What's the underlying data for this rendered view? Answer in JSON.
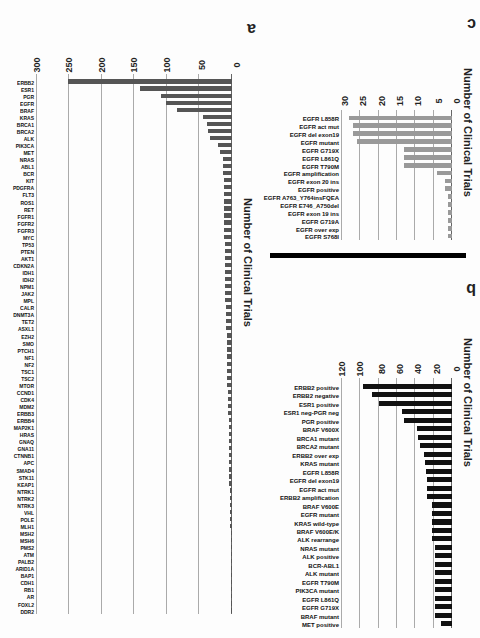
{
  "figure": {
    "panel_a": {
      "letter": "a",
      "ylabel": "Number of Clinical Trials"
    },
    "panel_b": {
      "letter": "b",
      "ylabel": "Number of Clinical Trials"
    },
    "panel_c": {
      "letter": "c",
      "ylabel": "Number of Clinical Trials"
    },
    "orientation": "rotated 180 degrees"
  },
  "chart_data": [
    {
      "panel": "a",
      "type": "bar",
      "title": "",
      "xlabel": "",
      "ylabel": "Number of Clinical Trials",
      "ylim": [
        0,
        300
      ],
      "yticks": [
        0,
        50,
        100,
        150,
        200,
        250,
        300
      ],
      "grid": true,
      "bar_color": "#555555",
      "categories": [
        "ERBB2",
        "ESR1",
        "PGR",
        "EGFR",
        "BRAF",
        "KRAS",
        "BRCA1",
        "BRCA2",
        "ALK",
        "PIK3CA",
        "MET",
        "NRAS",
        "ABL1",
        "BCR",
        "KIT",
        "PDGFRA",
        "FLT3",
        "ROS1",
        "RET",
        "FGFR1",
        "FGFR2",
        "FGFR3",
        "MYC",
        "TP53",
        "PTEN",
        "AKT1",
        "CDKN2A",
        "IDH1",
        "IDH2",
        "NPM1",
        "JAK2",
        "MPL",
        "CALR",
        "DNMT3A",
        "TET2",
        "ASXL1",
        "EZH2",
        "SMO",
        "PTCH1",
        "NF1",
        "NF2",
        "TSC1",
        "TSC2",
        "MTOR",
        "CCND1",
        "CDK4",
        "MDM2",
        "ERBB3",
        "ERBB4",
        "MAP2K1",
        "HRAS",
        "GNAQ",
        "GNA11",
        "CTNNB1",
        "APC",
        "SMAD4",
        "STK11",
        "KEAP1",
        "NTRK1",
        "NTRK2",
        "NTRK3",
        "VHL",
        "POLE",
        "MLH1",
        "MSH2",
        "MSH6",
        "PMS2",
        "ATM",
        "PALB2",
        "ARID1A",
        "BAP1",
        "CDH1",
        "RB1",
        "AR",
        "FOXL2",
        "DDR2"
      ],
      "values": [
        253,
        142,
        109,
        102,
        85,
        44,
        38,
        37,
        34,
        22,
        18,
        14,
        14,
        14,
        13,
        13,
        13,
        13,
        12,
        12,
        12,
        12,
        12,
        11,
        11,
        11,
        11,
        11,
        10,
        10,
        10,
        10,
        9,
        9,
        9,
        9,
        8,
        8,
        8,
        8,
        7,
        7,
        7,
        7,
        6,
        6,
        6,
        6,
        5,
        5,
        5,
        5,
        5,
        4,
        4,
        4,
        4,
        4,
        3,
        3,
        3,
        3,
        3,
        3,
        2,
        2,
        2,
        2,
        2,
        2,
        2,
        1,
        1,
        1,
        1,
        1
      ]
    },
    {
      "panel": "b",
      "type": "bar",
      "title": "",
      "xlabel": "",
      "ylabel": "Number of Clinical Trials",
      "ylim": [
        0,
        120
      ],
      "yticks": [
        0,
        20,
        40,
        60,
        80,
        100,
        120
      ],
      "grid": true,
      "bar_color": "#111111",
      "categories": [
        "ERBB2 positive",
        "ERBB2 negative",
        "ESR1 positive",
        "ESR1 neg-PGR neg",
        "PGR positive",
        "BRAF V600X",
        "BRCA1 mutant",
        "BRCA2 mutant",
        "ERBB2 over exp",
        "KRAS mutant",
        "EGFR L858R",
        "EGFR del exon19",
        "EGFR act mut",
        "ERBB2 amplification",
        "BRAF V600E",
        "EGFR mutant",
        "KRAS wild-type",
        "BRAF V600E/K",
        "ALK rearrange",
        "NRAS mutant",
        "ALK positive",
        "BCR-ABL1",
        "ALK mutant",
        "EGFR T790M",
        "PIK3CA mutant",
        "EGFR L861Q",
        "EGFR G719X",
        "BRAF mutant",
        "MET positive"
      ],
      "values": [
        97,
        87,
        80,
        55,
        52,
        38,
        37,
        35,
        30,
        29,
        28,
        27,
        27,
        27,
        22,
        22,
        22,
        22,
        22,
        18,
        18,
        18,
        18,
        18,
        18,
        18,
        18,
        18,
        12
      ]
    },
    {
      "panel": "c",
      "type": "bar",
      "title": "",
      "xlabel": "",
      "ylabel": "Number of Clinical Trials",
      "ylim": [
        0,
        30
      ],
      "yticks": [
        0,
        5,
        10,
        15,
        20,
        25,
        30
      ],
      "grid": true,
      "bar_color": "#999999",
      "categories": [
        "EGFR L858R",
        "EGFR act mut",
        "EGFR del exon19",
        "EGFR mutant",
        "EGFR G719X",
        "EGFR L861Q",
        "EGFR T790M",
        "EGFR amplification",
        "EGFR exon 20 ins",
        "EGFR positive",
        "EGFR A763_Y764insFQEA",
        "EGFR E746_A750del",
        "EGFR exon 19 ins",
        "EGFR G719A",
        "EGFR over exp",
        "EGFR S768I"
      ],
      "values": [
        28,
        27,
        27,
        26,
        13,
        13,
        13,
        4,
        2,
        2,
        1,
        1,
        1,
        1,
        1,
        1
      ]
    }
  ]
}
